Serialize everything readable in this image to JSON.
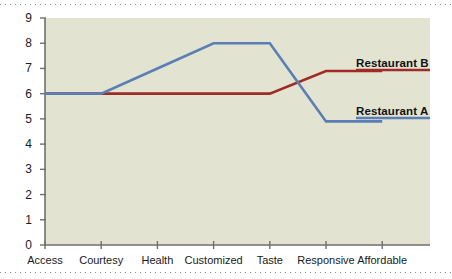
{
  "chart_data": {
    "type": "line",
    "title": "",
    "subtitle": "",
    "xlabel": "",
    "ylabel": "",
    "categories": [
      "Access",
      "Courtesy",
      "Health",
      "Customized",
      "Taste",
      "Responsive",
      "Affordable"
    ],
    "series": [
      {
        "name": "Restaurant A",
        "color": "#5b7fb4",
        "values": [
          6,
          6,
          7,
          8,
          8,
          4.9,
          4.9
        ]
      },
      {
        "name": "Restaurant B",
        "color": "#9e2b25",
        "values": [
          6,
          6,
          6,
          6,
          6,
          6.9,
          6.9
        ]
      }
    ],
    "ylim": [
      0,
      9
    ],
    "y_ticks": [
      0,
      1,
      2,
      3,
      4,
      5,
      6,
      7,
      8,
      9
    ],
    "y_tick_labels": [
      "0",
      "1",
      "2",
      "3",
      "4",
      "5",
      "6",
      "7",
      "8",
      "9"
    ],
    "grid": false,
    "legend": "inline-annotations",
    "annotations": [
      {
        "text": "Restaurant B",
        "series": "Restaurant B"
      },
      {
        "text": "Restaurant A",
        "series": "Restaurant A"
      }
    ],
    "plot_background": "#e3e3d2",
    "axis_color": "#6f6f6f"
  }
}
